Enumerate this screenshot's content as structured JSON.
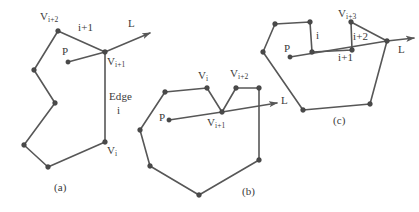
{
  "figure": {
    "width": 419,
    "height": 212,
    "line_color": "#575757",
    "vertex_color": "#4a4a4a",
    "text_color": "#3a3a3a",
    "background": "#ffffff"
  },
  "panels": [
    {
      "id": "panel-a",
      "caption": "(a)",
      "labels": {
        "v_i_plus_2": "V",
        "v_i_plus_2_sub": "i+2",
        "edge_i_plus_1": "i+1",
        "ray": "L",
        "point": "P",
        "v_i_plus_1": "V",
        "v_i_plus_1_sub": "i+1",
        "edge_word": "Edge",
        "edge_index": "i",
        "v_i": "V",
        "v_i_sub": "i"
      },
      "polygon_points": "58,31 105,52 105,142 48,167 24,145 55,103 34,70 58,31",
      "vertices": [
        [
          58,
          31
        ],
        [
          105,
          52
        ],
        [
          105,
          142
        ],
        [
          48,
          167
        ],
        [
          24,
          145
        ],
        [
          55,
          103
        ],
        [
          34,
          70
        ]
      ],
      "ray": {
        "from": [
          105,
          52
        ],
        "to": [
          150,
          33
        ]
      },
      "point_p": [
        68,
        62
      ],
      "point_p_segment": {
        "from": [
          68,
          62
        ],
        "to": [
          105,
          52
        ]
      }
    },
    {
      "id": "panel-b",
      "caption": "(b)",
      "labels": {
        "v_i": "V",
        "v_i_sub": "i",
        "v_i_plus_2": "V",
        "v_i_plus_2_sub": "i+2",
        "point": "P",
        "v_i_plus_1": "V",
        "v_i_plus_1_sub": "i+1",
        "ray": "L"
      },
      "polygon_points": "165,92 207,88 222,112 236,88 259,88 259,160 199,195 150,166 140,130 165,92",
      "vertices": [
        [
          165,
          92
        ],
        [
          207,
          88
        ],
        [
          222,
          112
        ],
        [
          236,
          88
        ],
        [
          259,
          88
        ],
        [
          259,
          160
        ],
        [
          199,
          195
        ],
        [
          150,
          166
        ],
        [
          140,
          130
        ]
      ],
      "ray": {
        "from": [
          222,
          112
        ],
        "to": [
          277,
          103
        ]
      },
      "point_p": [
        169,
        120
      ],
      "point_p_segment": {
        "from": [
          169,
          120
        ],
        "to": [
          222,
          112
        ]
      }
    },
    {
      "id": "panel-c",
      "caption": "(c)",
      "labels": {
        "v_i_plus_3": "V",
        "v_i_plus_3_sub": "i+3",
        "edge_i": "i",
        "edge_i_plus_2": "i+2",
        "ray": "L",
        "point": "P",
        "edge_i_plus_1": "i+1",
        "edge_i_plus_1_lower": "i+1"
      },
      "polygon_points": "275,24 310,22 312,52 352,50 351,22 387,41 370,104 303,110 263,52 275,24",
      "vertices": [
        [
          275,
          24
        ],
        [
          310,
          22
        ],
        [
          312,
          52
        ],
        [
          352,
          50
        ],
        [
          351,
          22
        ],
        [
          387,
          41
        ],
        [
          370,
          104
        ],
        [
          303,
          110
        ],
        [
          263,
          52
        ]
      ],
      "ray": {
        "from": [
          387,
          41
        ],
        "to": [
          412,
          38
        ]
      },
      "point_p": [
        290,
        57
      ],
      "point_p_segment": {
        "from": [
          290,
          57
        ],
        "to": [
          387,
          41
        ]
      }
    }
  ]
}
